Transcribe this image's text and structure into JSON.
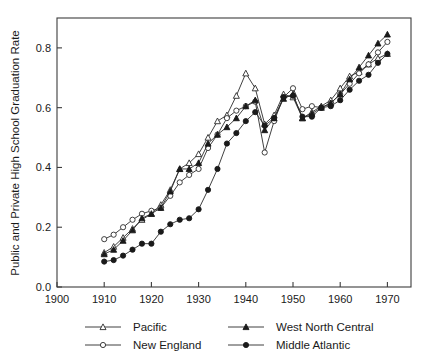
{
  "chart_data": {
    "type": "line",
    "title": "",
    "xlabel": "",
    "ylabel": "Public and Private High School Graduation Rate",
    "xlim": [
      1900,
      1975
    ],
    "ylim": [
      0.0,
      0.9
    ],
    "xticks": [
      1900,
      1910,
      1920,
      1930,
      1940,
      1950,
      1960,
      1970
    ],
    "xticklabels": [
      "1900",
      "1910",
      "1920",
      "1930",
      "1940",
      "1950",
      "1960",
      "1970"
    ],
    "yticks": [
      0.0,
      0.2,
      0.4,
      0.6,
      0.8
    ],
    "yticklabels": [
      "0.0",
      "0.2",
      "0.4",
      "0.6",
      "0.8"
    ],
    "grid": false,
    "legend_position": "below-axes",
    "x": [
      1910,
      1912,
      1914,
      1916,
      1918,
      1920,
      1922,
      1924,
      1926,
      1928,
      1930,
      1932,
      1934,
      1936,
      1938,
      1940,
      1942,
      1944,
      1946,
      1948,
      1950,
      1952,
      1954,
      1956,
      1958,
      1960,
      1962,
      1964,
      1966,
      1968,
      1970
    ],
    "series": [
      {
        "name": "Pacific",
        "marker": "open-triangle",
        "values": [
          0.115,
          0.135,
          0.165,
          0.195,
          0.225,
          0.245,
          0.275,
          0.325,
          0.395,
          0.415,
          0.445,
          0.5,
          0.555,
          0.575,
          0.64,
          0.715,
          0.665,
          0.545,
          0.575,
          0.645,
          0.635,
          0.565,
          0.585,
          0.605,
          0.625,
          0.665,
          0.705,
          0.72,
          0.745,
          0.765,
          0.78
        ]
      },
      {
        "name": "New England",
        "marker": "open-circle",
        "values": [
          0.16,
          0.175,
          0.2,
          0.225,
          0.245,
          0.255,
          0.265,
          0.305,
          0.35,
          0.375,
          0.395,
          0.465,
          0.51,
          0.565,
          0.59,
          0.605,
          0.62,
          0.45,
          0.555,
          0.635,
          0.665,
          0.595,
          0.605,
          0.6,
          0.615,
          0.645,
          0.68,
          0.715,
          0.745,
          0.785,
          0.82
        ]
      },
      {
        "name": "West North Central",
        "marker": "filled-triangle",
        "values": [
          0.11,
          0.125,
          0.155,
          0.19,
          0.23,
          0.245,
          0.265,
          0.32,
          0.395,
          0.395,
          0.415,
          0.48,
          0.51,
          0.535,
          0.565,
          0.605,
          0.625,
          0.525,
          0.565,
          0.63,
          0.645,
          0.565,
          0.58,
          0.6,
          0.615,
          0.645,
          0.695,
          0.735,
          0.775,
          0.815,
          0.845
        ]
      },
      {
        "name": "Middle Atlantic",
        "marker": "filled-circle",
        "values": [
          0.085,
          0.09,
          0.105,
          0.125,
          0.145,
          0.145,
          0.185,
          0.21,
          0.225,
          0.23,
          0.26,
          0.325,
          0.395,
          0.48,
          0.515,
          0.555,
          0.585,
          0.54,
          0.565,
          0.635,
          0.64,
          0.57,
          0.57,
          0.6,
          0.605,
          0.625,
          0.66,
          0.69,
          0.71,
          0.75,
          0.78
        ]
      }
    ],
    "legend_entries": [
      {
        "label": "Pacific",
        "marker": "open-triangle"
      },
      {
        "label": "New England",
        "marker": "open-circle"
      },
      {
        "label": "West North Central",
        "marker": "filled-triangle"
      },
      {
        "label": "Middle Atlantic",
        "marker": "filled-circle"
      }
    ],
    "colors": {
      "line": "#2b2b2b",
      "axis": "#3c3c3c",
      "background": "#ffffff"
    }
  }
}
